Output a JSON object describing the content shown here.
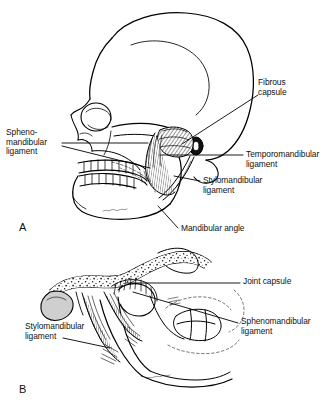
{
  "figure": {
    "ink_color": "#000000",
    "background_color": "#ffffff",
    "panels": [
      {
        "letter": "A",
        "name": "lateral-skull-view",
        "description": "Lateral view of skull and mandible showing temporomandibular joint ligaments",
        "labels": [
          {
            "name": "fibrous-capsule",
            "text": "Fibrous\ncapsule"
          },
          {
            "name": "temporomandibular-ligament",
            "text": "Temporomandibular\nligament"
          },
          {
            "name": "stylomandibular-ligament",
            "text": "Stylomandibular\nligament"
          },
          {
            "name": "sphenomandibular-ligament",
            "text": "Spheno-\nmandibular\nligament"
          },
          {
            "name": "mandibular-angle",
            "text": "Mandibular angle"
          }
        ]
      },
      {
        "letter": "B",
        "name": "medial-skull-view",
        "description": "Medial view of cranial base and mandible showing joint capsule and medial ligaments",
        "labels": [
          {
            "name": "joint-capsule",
            "text": "Joint capsule"
          },
          {
            "name": "sphenomandibular-ligament",
            "text": "Sphenomandibular\nligament"
          },
          {
            "name": "stylomandibular-ligament",
            "text": "Stylomandibular\nligament"
          }
        ]
      }
    ]
  },
  "panel_a": {
    "letter": "A",
    "fibrous_capsule": "Fibrous\ncapsule",
    "temporomandibular_ligament": "Temporomandibular\nligament",
    "stylomandibular_ligament": "Stylomandibular\nligament",
    "sphenomandibular_ligament": "Spheno-\nmandibular\nligament",
    "mandibular_angle": "Mandibular angle"
  },
  "panel_b": {
    "letter": "B",
    "joint_capsule": "Joint capsule",
    "sphenomandibular_ligament": "Sphenomandibular\nligament",
    "stylomandibular_ligament": "Stylomandibular\nligament"
  }
}
